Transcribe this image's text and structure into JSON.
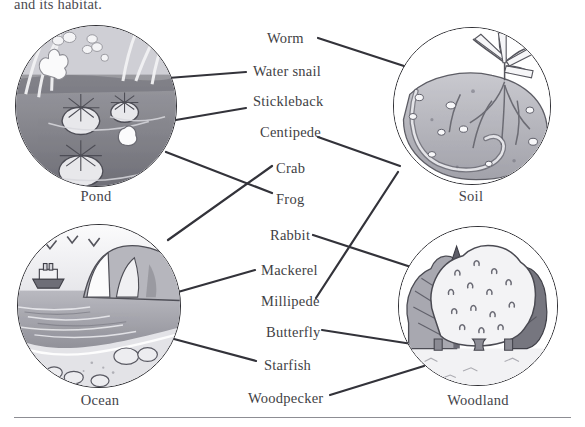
{
  "worksheet": {
    "instruction_fragment": "and its habitat."
  },
  "habitats": [
    {
      "id": "pond",
      "label": "Pond",
      "scene_description": "pond with lily pads, water, reeds and iris flower",
      "cx": 96,
      "cy": 106,
      "r": 81,
      "label_x": 15,
      "label_y": 188
    },
    {
      "id": "soil",
      "label": "Soil",
      "scene_description": "soil cross-section with seedling roots and earthworm",
      "cx": 472,
      "cy": 106,
      "r": 79,
      "label_x": 392,
      "label_y": 188
    },
    {
      "id": "ocean",
      "label": "Ocean",
      "scene_description": "ocean with seagulls, ship, cliff, waves and pebble beach",
      "cx": 99,
      "cy": 306,
      "r": 82,
      "label_x": 18,
      "label_y": 392
    },
    {
      "id": "woodland",
      "label": "Woodland",
      "scene_description": "woodland with broadleaf and conifer trees",
      "cx": 478,
      "cy": 306,
      "r": 80,
      "label_x": 398,
      "label_y": 392
    }
  ],
  "animals": [
    {
      "id": "worm",
      "label": "Worm",
      "x": 267,
      "y": 30,
      "habitat": "soil"
    },
    {
      "id": "water-snail",
      "label": "Water snail",
      "x": 253,
      "y": 63,
      "habitat": "pond"
    },
    {
      "id": "stickleback",
      "label": "Stickleback",
      "x": 253,
      "y": 93,
      "habitat": "pond"
    },
    {
      "id": "centipede",
      "label": "Centipede",
      "x": 260,
      "y": 124,
      "habitat": "soil"
    },
    {
      "id": "crab",
      "label": "Crab",
      "x": 276,
      "y": 160,
      "habitat": "ocean"
    },
    {
      "id": "frog",
      "label": "Frog",
      "x": 276,
      "y": 191,
      "habitat": "pond"
    },
    {
      "id": "rabbit",
      "label": "Rabbit",
      "x": 270,
      "y": 227,
      "habitat": "woodland"
    },
    {
      "id": "mackerel",
      "label": "Mackerel",
      "x": 261,
      "y": 262,
      "habitat": "ocean"
    },
    {
      "id": "millipede",
      "label": "Millipede",
      "x": 261,
      "y": 293,
      "habitat": "soil"
    },
    {
      "id": "butterfly",
      "label": "Butterfly",
      "x": 266,
      "y": 324,
      "habitat": "woodland"
    },
    {
      "id": "starfish",
      "label": "Starfish",
      "x": 264,
      "y": 357,
      "habitat": "ocean"
    },
    {
      "id": "woodpecker",
      "label": "Woodpecker",
      "x": 248,
      "y": 390,
      "habitat": "woodland"
    }
  ],
  "connections": [
    {
      "animal": "worm",
      "habitat": "soil",
      "x1": 318,
      "y1": 38,
      "x2": 404,
      "y2": 66
    },
    {
      "animal": "water-snail",
      "habitat": "pond",
      "x1": 246,
      "y1": 72,
      "x2": 168,
      "y2": 78
    },
    {
      "animal": "stickleback",
      "habitat": "pond",
      "x1": 246,
      "y1": 108,
      "x2": 170,
      "y2": 121
    },
    {
      "animal": "centipede",
      "habitat": "soil",
      "x1": 318,
      "y1": 137,
      "x2": 400,
      "y2": 166
    },
    {
      "animal": "crab",
      "habitat": "ocean",
      "x1": 272,
      "y1": 166,
      "x2": 168,
      "y2": 240
    },
    {
      "animal": "frog",
      "habitat": "pond",
      "x1": 272,
      "y1": 193,
      "x2": 166,
      "y2": 152
    },
    {
      "animal": "rabbit",
      "habitat": "woodland",
      "x1": 313,
      "y1": 235,
      "x2": 414,
      "y2": 268
    },
    {
      "animal": "mackerel",
      "habitat": "ocean",
      "x1": 255,
      "y1": 270,
      "x2": 178,
      "y2": 292
    },
    {
      "animal": "millipede",
      "habitat": "soil",
      "x1": 316,
      "y1": 298,
      "x2": 398,
      "y2": 172
    },
    {
      "animal": "butterfly",
      "habitat": "woodland",
      "x1": 322,
      "y1": 330,
      "x2": 412,
      "y2": 344
    },
    {
      "animal": "starfish",
      "habitat": "ocean",
      "x1": 256,
      "y1": 361,
      "x2": 174,
      "y2": 339
    },
    {
      "animal": "woodpecker",
      "habitat": "woodland",
      "x1": 330,
      "y1": 395,
      "x2": 424,
      "y2": 366
    }
  ],
  "style": {
    "line_color": "#33333a",
    "ink_color": "#3f3f45",
    "rule_color": "#8d8d93"
  }
}
